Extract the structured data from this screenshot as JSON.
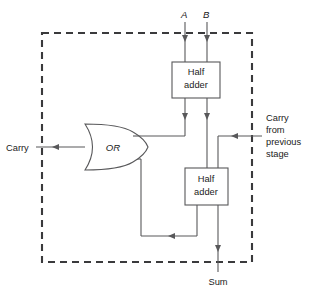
{
  "diagram": {
    "type": "logic-circuit-schematic",
    "colors": {
      "wire": "#58585a",
      "boundary": "#3a3a3c",
      "text": "#1b1b1b",
      "background": "#ffffff"
    },
    "blocks": [
      {
        "id": "half_adder_top",
        "line1": "Half",
        "line2": "adder"
      },
      {
        "id": "half_adder_bottom",
        "line1": "Half",
        "line2": "adder"
      }
    ],
    "gates": [
      {
        "id": "or_gate",
        "label": "OR",
        "type": "OR"
      }
    ],
    "inputs": [
      {
        "id": "input_a",
        "label": "A"
      },
      {
        "id": "input_b",
        "label": "B"
      },
      {
        "id": "carry_in",
        "label_line1": "Carry",
        "label_line2": "from",
        "label_line3": "previous",
        "label_line4": "stage"
      }
    ],
    "outputs": [
      {
        "id": "carry_out",
        "label": "Carry"
      },
      {
        "id": "sum_out",
        "label": "Sum"
      }
    ],
    "boundary": {
      "style": "dashed",
      "description": "full adder stage boundary"
    }
  }
}
